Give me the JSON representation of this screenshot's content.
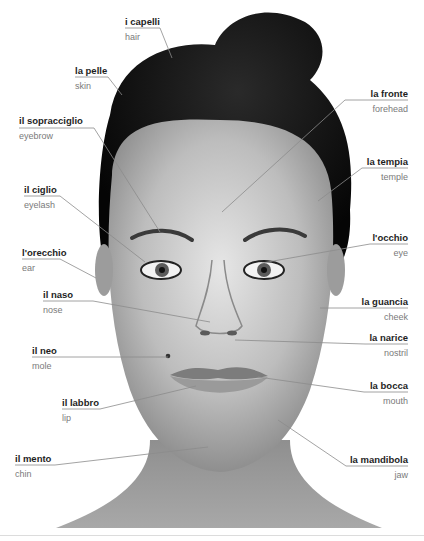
{
  "diagram": {
    "colors": {
      "italian_text": "#1e1e1e",
      "english_text": "#7a7a7a",
      "leader_line": "#8c8c8c"
    },
    "labels": [
      {
        "id": "hair",
        "italian": "i capelli",
        "english": "hair",
        "side": "left",
        "x": 125,
        "y": 17,
        "w": 45,
        "line": [
          [
            125,
            28
          ],
          [
            160,
            28
          ],
          [
            172,
            58
          ]
        ]
      },
      {
        "id": "skin",
        "italian": "la pelle",
        "english": "skin",
        "side": "left",
        "x": 75,
        "y": 66,
        "w": 40,
        "line": [
          [
            75,
            77
          ],
          [
            108,
            77
          ],
          [
            122,
            95
          ]
        ]
      },
      {
        "id": "eyebrow",
        "italian": "il sopracciglio",
        "english": "eyebrow",
        "side": "left",
        "x": 19,
        "y": 116,
        "w": 75,
        "line": [
          [
            19,
            128
          ],
          [
            94,
            128
          ],
          [
            160,
            232
          ]
        ]
      },
      {
        "id": "eyelash",
        "italian": "il ciglio",
        "english": "eyelash",
        "side": "left",
        "x": 24,
        "y": 185,
        "w": 45,
        "line": [
          [
            24,
            196
          ],
          [
            60,
            196
          ],
          [
            145,
            262
          ]
        ]
      },
      {
        "id": "ear",
        "italian": "l'orecchio",
        "english": "ear",
        "side": "left",
        "x": 22,
        "y": 248,
        "w": 50,
        "line": [
          [
            22,
            259
          ],
          [
            60,
            259
          ],
          [
            96,
            278
          ]
        ]
      },
      {
        "id": "nose",
        "italian": "il naso",
        "english": "nose",
        "side": "left",
        "x": 43,
        "y": 290,
        "w": 50,
        "line": [
          [
            43,
            301
          ],
          [
            93,
            301
          ],
          [
            210,
            322
          ]
        ]
      },
      {
        "id": "mole",
        "italian": "il neo",
        "english": "mole",
        "side": "left",
        "x": 32,
        "y": 346,
        "w": 50,
        "line": [
          [
            32,
            357
          ],
          [
            90,
            357
          ],
          [
            168,
            357
          ]
        ]
      },
      {
        "id": "lip",
        "italian": "il labbro",
        "english": "lip",
        "side": "left",
        "x": 62,
        "y": 398,
        "w": 38,
        "line": [
          [
            62,
            409
          ],
          [
            100,
            409
          ],
          [
            196,
            386
          ]
        ]
      },
      {
        "id": "chin",
        "italian": "il mento",
        "english": "chin",
        "side": "left",
        "x": 15,
        "y": 454,
        "w": 40,
        "line": [
          [
            15,
            465
          ],
          [
            55,
            465
          ],
          [
            208,
            447
          ]
        ]
      },
      {
        "id": "forehead",
        "italian": "la fronte",
        "english": "forehead",
        "side": "right",
        "x": 360,
        "y": 89,
        "w": 48,
        "line": [
          [
            408,
            100
          ],
          [
            345,
            100
          ],
          [
            222,
            212
          ]
        ]
      },
      {
        "id": "temple",
        "italian": "la tempia",
        "english": "temple",
        "side": "right",
        "x": 368,
        "y": 157,
        "w": 40,
        "line": [
          [
            408,
            168
          ],
          [
            362,
            168
          ],
          [
            318,
            201
          ]
        ]
      },
      {
        "id": "eye",
        "italian": "l'occhio",
        "english": "eye",
        "side": "right",
        "x": 375,
        "y": 233,
        "w": 33,
        "line": [
          [
            408,
            244
          ],
          [
            370,
            244
          ],
          [
            262,
            263
          ]
        ]
      },
      {
        "id": "cheek",
        "italian": "la guancia",
        "english": "cheek",
        "side": "right",
        "x": 354,
        "y": 297,
        "w": 54,
        "line": [
          [
            408,
            308
          ],
          [
            354,
            308
          ],
          [
            320,
            308
          ]
        ]
      },
      {
        "id": "nostril",
        "italian": "la narice",
        "english": "nostril",
        "side": "right",
        "x": 365,
        "y": 333,
        "w": 43,
        "line": [
          [
            408,
            344
          ],
          [
            365,
            344
          ],
          [
            235,
            340
          ]
        ]
      },
      {
        "id": "mouth",
        "italian": "la bocca",
        "english": "mouth",
        "side": "right",
        "x": 364,
        "y": 381,
        "w": 44,
        "line": [
          [
            408,
            392
          ],
          [
            364,
            392
          ],
          [
            258,
            377
          ]
        ]
      },
      {
        "id": "jaw",
        "italian": "la mandibola",
        "english": "jaw",
        "side": "right",
        "x": 346,
        "y": 455,
        "w": 62,
        "line": [
          [
            408,
            466
          ],
          [
            346,
            466
          ],
          [
            278,
            420
          ]
        ]
      }
    ]
  }
}
